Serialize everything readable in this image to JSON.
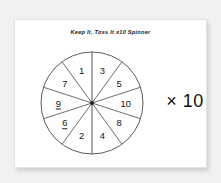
{
  "worksheet": {
    "title": "Keep It, Toss It x10 Spinner",
    "multiplier_label": "× 10"
  },
  "spinner": {
    "name": "ten-sector-spinner",
    "sector_count": 10,
    "sector_angle_degrees": 36,
    "center": {
      "x": 55,
      "y": 55
    },
    "radius": 51,
    "outline_color": "#4a4a4a",
    "main_divider_color": "#6b6b6b",
    "face_color": "#ffffff",
    "sectors": [
      {
        "label": "3",
        "underlined": false,
        "mid_angle_degrees": 18
      },
      {
        "label": "5",
        "underlined": false,
        "mid_angle_degrees": 54
      },
      {
        "label": "10",
        "underlined": false,
        "mid_angle_degrees": 90
      },
      {
        "label": "8",
        "underlined": false,
        "mid_angle_degrees": 126
      },
      {
        "label": "4",
        "underlined": false,
        "mid_angle_degrees": 162
      },
      {
        "label": "2",
        "underlined": false,
        "mid_angle_degrees": 198
      },
      {
        "label": "6",
        "underlined": true,
        "mid_angle_degrees": 234
      },
      {
        "label": "9",
        "underlined": true,
        "mid_angle_degrees": 270
      },
      {
        "label": "7",
        "underlined": false,
        "mid_angle_degrees": 306
      },
      {
        "label": "1",
        "underlined": false,
        "mid_angle_degrees": 342
      }
    ]
  },
  "colors": {
    "page_background": "#f1f1f1",
    "card_background": "#ffffff",
    "card_border": "#e3e3e3",
    "text": "#141414"
  }
}
